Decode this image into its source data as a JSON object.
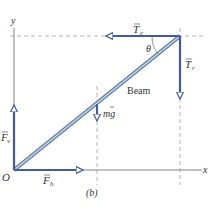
{
  "figure": {
    "caption": "(b)",
    "colors": {
      "vector": "#3f5aa8",
      "beam": "#8fb3cf",
      "beam_edge": "#5d7fa6",
      "axis": "#777777",
      "dashed": "#999999",
      "text": "#333333"
    },
    "axes": {
      "x_label": "x",
      "y_label": "y",
      "origin_label": "O"
    },
    "beam_label": "Beam",
    "angle_label": "θ",
    "forces": [
      {
        "name": "T_c",
        "label": "T",
        "subscript": "c",
        "direction": "left"
      },
      {
        "name": "T_r",
        "label": "T",
        "subscript": "r",
        "direction": "down"
      },
      {
        "name": "mg",
        "label": "mg",
        "subscript": "",
        "direction": "down"
      },
      {
        "name": "F_v",
        "label": "F",
        "subscript": "v",
        "direction": "up"
      },
      {
        "name": "F_h",
        "label": "F",
        "subscript": "h",
        "direction": "right"
      }
    ]
  }
}
